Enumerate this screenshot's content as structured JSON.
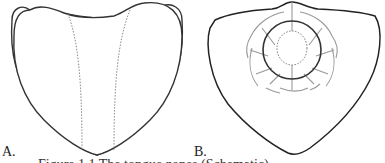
{
  "figure": {
    "panels": [
      {
        "label": "A.",
        "description": "Tongue outline with two dotted longitudinal lines marking central region"
      },
      {
        "label": "B.",
        "description": "Tongue outline with concentric circles and radial segmented arcs"
      }
    ],
    "caption": "Figure 1.1  The tongue zones (Schematic)",
    "colors": {
      "outline": "#333333",
      "dotted": "#888888",
      "segments": "#999999"
    }
  }
}
